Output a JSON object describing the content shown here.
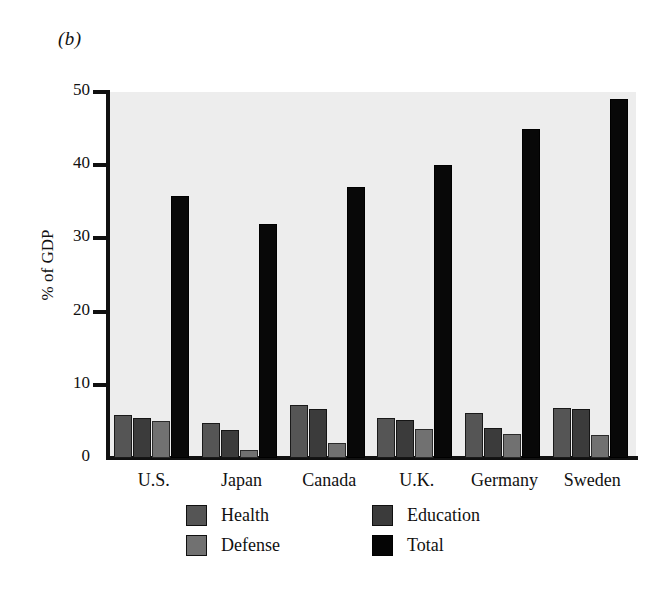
{
  "panel": {
    "label": "(b)"
  },
  "chart_data": {
    "type": "bar",
    "title": "",
    "panel_label": "(b)",
    "xlabel": "",
    "ylabel": "% of GDP",
    "ylim": [
      0,
      50
    ],
    "yticks": [
      0,
      10,
      20,
      30,
      40,
      50
    ],
    "ytick_labels": [
      "0",
      "10",
      "20",
      "30",
      "40",
      "50"
    ],
    "grid": false,
    "legend_position": "bottom",
    "categories": [
      "U.S.",
      "Japan",
      "Canada",
      "U.K.",
      "Germany",
      "Sweden"
    ],
    "series": [
      {
        "name": "Health",
        "color": "#555555",
        "values": [
          5.9,
          4.8,
          7.3,
          5.5,
          6.1,
          6.8
        ]
      },
      {
        "name": "Education",
        "color": "#3b3b3b",
        "values": [
          5.4,
          3.8,
          6.7,
          5.2,
          4.1,
          6.7
        ]
      },
      {
        "name": "Defense",
        "color": "#717171",
        "values": [
          5.1,
          1.1,
          2.0,
          4.0,
          3.3,
          3.2
        ]
      },
      {
        "name": "Total",
        "color": "#050505",
        "values": [
          35.8,
          32.0,
          37.0,
          40.0,
          45.0,
          49.0
        ]
      }
    ]
  },
  "legend": {
    "items": [
      {
        "label": "Health",
        "swatch": "health"
      },
      {
        "label": "Education",
        "swatch": "education"
      },
      {
        "label": "Defense",
        "swatch": "defense"
      },
      {
        "label": "Total",
        "swatch": "total"
      }
    ]
  }
}
